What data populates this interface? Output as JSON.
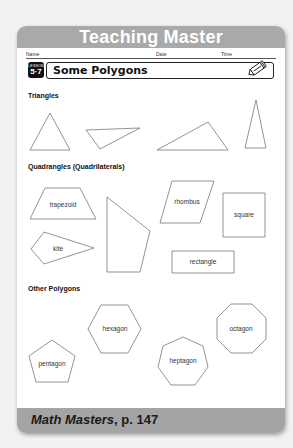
{
  "header": {
    "title": "Teaching Master"
  },
  "meta": {
    "name_label": "Name",
    "date_label": "Date",
    "time_label": "Time"
  },
  "lesson": {
    "badge_label": "LESSON",
    "number": "5·7",
    "title": "Some Polygons",
    "icon": "pencil-icon"
  },
  "sections": {
    "triangles": {
      "heading": "Triangles"
    },
    "quadrangles": {
      "heading": "Quadrangles (Quadrilaterals)",
      "labels": {
        "trapezoid": "trapezoid",
        "kite": "kite",
        "rhombus": "rhombus",
        "square": "square",
        "rectangle": "rectangle"
      }
    },
    "other": {
      "heading": "Other Polygons",
      "labels": {
        "hexagon": "hexagon",
        "pentagon": "pentagon",
        "heptagon": "heptagon",
        "octagon": "octagon"
      }
    }
  },
  "footer": {
    "book": "Math Masters",
    "page": ", p. 147"
  },
  "colors": {
    "header_gray": "#a9a9a9",
    "footer_gray": "#a4a4a4",
    "badge": "#111111"
  }
}
